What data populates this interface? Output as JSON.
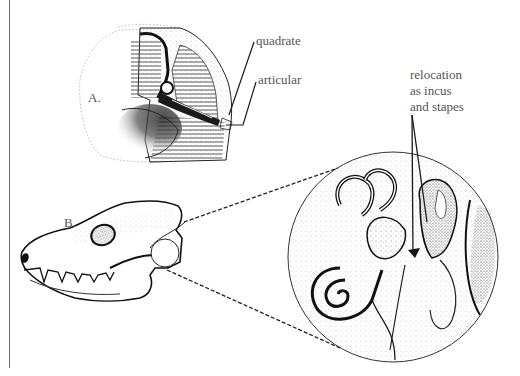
{
  "figure": {
    "panels": [
      {
        "id": "A",
        "label": "A.",
        "description": "reptile-like jaw joint cross-section"
      },
      {
        "id": "B",
        "label": "B.",
        "description": "mammal-like skull with magnified ear region"
      }
    ],
    "annotations": {
      "quadrate": "quadrate",
      "articular": "articular",
      "relocation_lines": [
        "relocation",
        "as incus",
        "and stapes"
      ]
    },
    "colors": {
      "ink": "#1a1a1a",
      "label_text": "#555555",
      "hatch": "#444444",
      "stipple": "#888888",
      "rule": "#6a6a6a"
    }
  }
}
